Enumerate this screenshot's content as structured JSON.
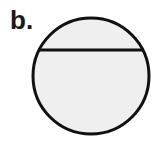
{
  "figure": {
    "label": "b.",
    "shape": "circle with horizontal chord",
    "colors": {
      "fill": "#efefef",
      "stroke": "#111111"
    },
    "circle": {
      "cx": 91,
      "cy": 76,
      "r": 58
    },
    "chord": {
      "x1": 38,
      "y1": 50,
      "x2": 144,
      "y2": 50
    }
  }
}
